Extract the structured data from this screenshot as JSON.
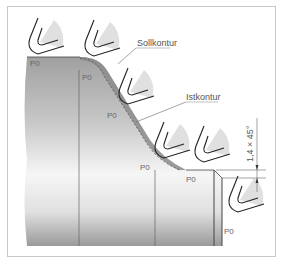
{
  "diagram": {
    "labels": {
      "soll": "Sollkontur",
      "ist": "Istkontur",
      "dimension": "1,4 × 45°"
    },
    "reference_points": [
      "P0",
      "P0",
      "P0",
      "P0",
      "P0",
      "P0"
    ],
    "colors": {
      "workpiece": "#a8a8a8",
      "workpiece_light": "#f4f4f4",
      "ist_band": "#8c8c8c",
      "tool_fill": "#e0e0e0",
      "outline": "#222222",
      "frame": "#c8c8c8"
    }
  }
}
